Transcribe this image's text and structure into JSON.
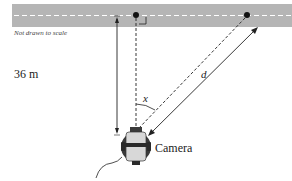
{
  "diagram": {
    "note": "Not drawn to scale",
    "distance_label": "36 m",
    "angle_label": "x",
    "hypotenuse_label": "d",
    "camera_label": "Camera",
    "colors": {
      "road": "#b5b5b5",
      "road_stripe": "#ffffff",
      "line": "#222222",
      "camera_body": "#d8d8d8",
      "camera_dark": "#3a3a3a"
    }
  }
}
